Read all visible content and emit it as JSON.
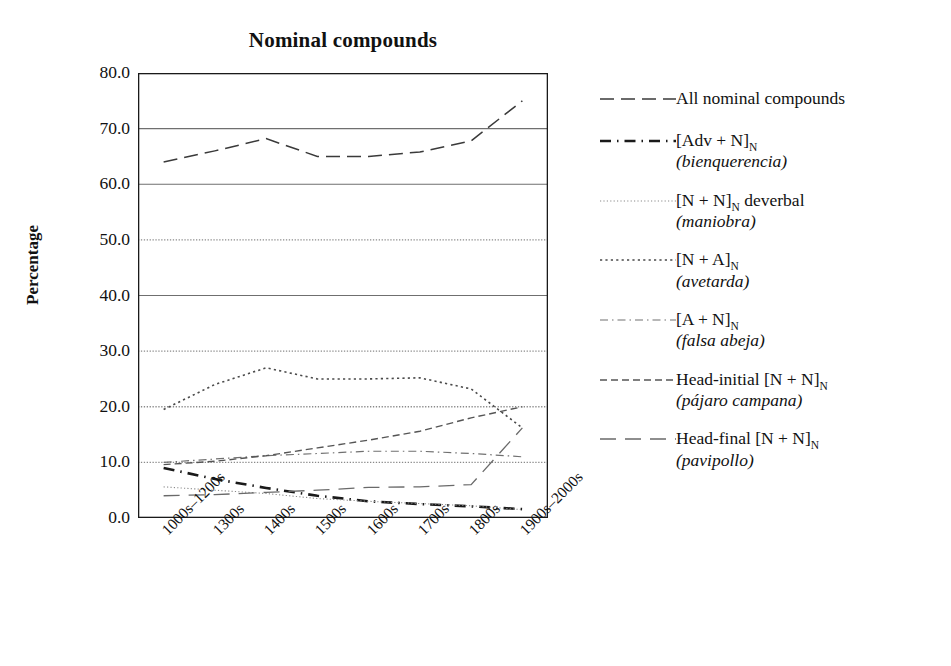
{
  "chart_data": {
    "type": "line",
    "title": "Nominal compounds",
    "xlabel": "",
    "ylabel": "Percentage",
    "ylim": [
      0,
      80
    ],
    "ytick_labels": [
      "80.0",
      "70.0",
      "60.0",
      "50.0",
      "40.0",
      "30.0",
      "20.0",
      "10.0",
      "0.0"
    ],
    "ytick_values": [
      80,
      70,
      60,
      50,
      40,
      30,
      20,
      10,
      0
    ],
    "grid": "horizontal",
    "legend_position": "right",
    "categories": [
      "1000s–1200s",
      "1300s",
      "1400s",
      "1500s",
      "1600s",
      "1700s",
      "1800s",
      "1900s–2000s"
    ],
    "series": [
      {
        "name": "All nominal compounds",
        "example": "",
        "dash": "14,7",
        "width": 1.5,
        "color": "#3a3a3a",
        "values": [
          64.0,
          66.0,
          68.2,
          65.0,
          65.0,
          65.8,
          67.8,
          75.0
        ]
      },
      {
        "name": "[Adv + N]N",
        "example": "bienquerencia",
        "dash": "11,6,1.5,6",
        "width": 2.6,
        "color": "#1a1a1a",
        "values": [
          9.0,
          7.0,
          5.4,
          4.0,
          3.0,
          2.5,
          2.1,
          1.6
        ]
      },
      {
        "name": "[N + N]N deverbal",
        "example": "maniobra",
        "dash": "1.2,2.2",
        "width": 1.1,
        "color": "#8a8a8a",
        "values": [
          5.6,
          5.0,
          4.4,
          3.5,
          3.0,
          2.6,
          2.2,
          1.5
        ]
      },
      {
        "name": "[N + A]N",
        "example": "avetarda",
        "dash": "2.2,3.2",
        "width": 1.6,
        "color": "#4a4a4a",
        "values": [
          19.5,
          24.0,
          27.0,
          25.0,
          25.0,
          25.2,
          23.2,
          16.2
        ]
      },
      {
        "name": "[A + N]N",
        "example": "falsa abeja",
        "dash": "8,4,1.5,4",
        "width": 1.2,
        "color": "#707070",
        "values": [
          10.0,
          10.6,
          11.2,
          11.6,
          12.0,
          12.0,
          11.6,
          11.0
        ]
      },
      {
        "name": "Head-initial [N + N]N",
        "example": "pájaro campana",
        "dash": "7,4",
        "width": 1.4,
        "color": "#555555",
        "values": [
          9.6,
          10.2,
          11.2,
          12.6,
          14.0,
          15.6,
          18.0,
          20.0
        ]
      },
      {
        "name": "Head-final [N + N]N",
        "example": "pavipollo",
        "dash": "16,9",
        "width": 1.3,
        "color": "#6a6a6a",
        "values": [
          4.0,
          4.2,
          4.6,
          5.0,
          5.5,
          5.6,
          6.0,
          16.2
        ]
      }
    ]
  },
  "legend": {
    "entries": [
      {
        "swatch": "legend-line-all-nominal-compounds",
        "line1_pre": "All nominal compounds",
        "line1_sub": "",
        "line1_post": "",
        "line2": ""
      },
      {
        "swatch": "legend-line-adv-n",
        "line1_pre": "[Adv + N]",
        "line1_sub": "N",
        "line1_post": "",
        "line2": "(bienquerencia)"
      },
      {
        "swatch": "legend-line-n-n-deverbal",
        "line1_pre": "[N + N]",
        "line1_sub": "N",
        "line1_post": " deverbal",
        "line2": "(maniobra)"
      },
      {
        "swatch": "legend-line-n-a",
        "line1_pre": "[N + A]",
        "line1_sub": "N",
        "line1_post": "",
        "line2": "(avetarda)"
      },
      {
        "swatch": "legend-line-a-n",
        "line1_pre": "[A + N]",
        "line1_sub": "N",
        "line1_post": "",
        "line2": "(falsa abeja)"
      },
      {
        "swatch": "legend-line-head-initial",
        "line1_pre": "Head-initial [N + N]",
        "line1_sub": "N",
        "line1_post": "",
        "line2": "(pájaro campana)"
      },
      {
        "swatch": "legend-line-head-final",
        "line1_pre": "Head-final [N + N]",
        "line1_sub": "N",
        "line1_post": "",
        "line2": "(pavipollo)"
      }
    ]
  },
  "colors": {
    "axis": "#1a1a1a",
    "gridline_solid": "#6f6f6f",
    "gridline_dotted": "#8a8a8a",
    "text": "#111111",
    "background": "#ffffff"
  }
}
